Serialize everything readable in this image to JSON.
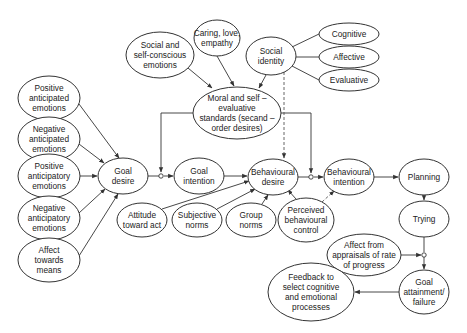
{
  "diagram": {
    "title": "",
    "nodes": [
      {
        "id": "pos_anticipated",
        "lines": [
          "Positive",
          "anticipated",
          "emotions"
        ],
        "cx": 49,
        "cy": 98,
        "rx": 31,
        "ry": 22
      },
      {
        "id": "neg_anticipated",
        "lines": [
          "Negative",
          "anticipated",
          "emotions"
        ],
        "cx": 49,
        "cy": 139,
        "rx": 31,
        "ry": 22
      },
      {
        "id": "pos_anticipatory",
        "lines": [
          "Positive",
          "anticipatory",
          "emotions"
        ],
        "cx": 49,
        "cy": 176,
        "rx": 31,
        "ry": 22
      },
      {
        "id": "neg_anticipatory",
        "lines": [
          "Negative",
          "anticipatory",
          "emotions"
        ],
        "cx": 49,
        "cy": 218,
        "rx": 31,
        "ry": 22
      },
      {
        "id": "affect_means",
        "lines": [
          "Affect",
          "towards",
          "means"
        ],
        "cx": 49,
        "cy": 260,
        "rx": 31,
        "ry": 22
      },
      {
        "id": "social_self_conscious",
        "lines": [
          "Social and",
          "self-conscious",
          "emotions"
        ],
        "cx": 160,
        "cy": 55,
        "rx": 34,
        "ry": 23
      },
      {
        "id": "caring",
        "lines": [
          "Caring, love,",
          "empathy"
        ],
        "cx": 217,
        "cy": 38,
        "rx": 23,
        "ry": 18
      },
      {
        "id": "social_identity",
        "lines": [
          "Social",
          "identity"
        ],
        "cx": 271,
        "cy": 56,
        "rx": 25,
        "ry": 19
      },
      {
        "id": "cognitive",
        "lines": [
          "Cognitive"
        ],
        "cx": 349,
        "cy": 34,
        "rx": 30,
        "ry": 11
      },
      {
        "id": "affective",
        "lines": [
          "Affective"
        ],
        "cx": 349,
        "cy": 57,
        "rx": 30,
        "ry": 11
      },
      {
        "id": "evaluative",
        "lines": [
          "Evaluative"
        ],
        "cx": 349,
        "cy": 80,
        "rx": 30,
        "ry": 11
      },
      {
        "id": "moral",
        "lines": [
          "Moral and self –",
          "evaluative",
          "standards (secand –",
          "order desires)"
        ],
        "cx": 237,
        "cy": 113,
        "rx": 44,
        "ry": 26
      },
      {
        "id": "goal_desire",
        "lines": [
          "Goal",
          "desire"
        ],
        "cx": 123,
        "cy": 176,
        "rx": 25,
        "ry": 18
      },
      {
        "id": "goal_intention",
        "lines": [
          "Goal",
          "intention"
        ],
        "cx": 199,
        "cy": 176,
        "rx": 25,
        "ry": 18
      },
      {
        "id": "behavioural_desire",
        "lines": [
          "Behavioural",
          "desire"
        ],
        "cx": 273,
        "cy": 177,
        "rx": 25,
        "ry": 18
      },
      {
        "id": "behavioural_intention",
        "lines": [
          "Behavioural",
          "intention"
        ],
        "cx": 349,
        "cy": 177,
        "rx": 25,
        "ry": 18
      },
      {
        "id": "planning",
        "lines": [
          "Planning"
        ],
        "cx": 424,
        "cy": 177,
        "rx": 25,
        "ry": 18
      },
      {
        "id": "trying",
        "lines": [
          "Trying"
        ],
        "cx": 424,
        "cy": 219,
        "rx": 25,
        "ry": 18
      },
      {
        "id": "attitude",
        "lines": [
          "Attitude",
          "toward act"
        ],
        "cx": 142,
        "cy": 220,
        "rx": 25,
        "ry": 17
      },
      {
        "id": "subjective_norms",
        "lines": [
          "Subjective",
          "norms"
        ],
        "cx": 197,
        "cy": 220,
        "rx": 25,
        "ry": 17
      },
      {
        "id": "group_norms",
        "lines": [
          "Group",
          "norms"
        ],
        "cx": 251,
        "cy": 220,
        "rx": 25,
        "ry": 17
      },
      {
        "id": "pbc",
        "lines": [
          "Perceived",
          "behavioural",
          "control"
        ],
        "cx": 306,
        "cy": 220,
        "rx": 28,
        "ry": 22
      },
      {
        "id": "affect_appraisals",
        "lines": [
          "Affect from",
          "appraisals of rate",
          "of progress"
        ],
        "cx": 364,
        "cy": 255,
        "rx": 37,
        "ry": 21
      },
      {
        "id": "goal_attainment",
        "lines": [
          "Goal",
          "attainment/",
          "failure"
        ],
        "cx": 424,
        "cy": 292,
        "rx": 25,
        "ry": 22
      },
      {
        "id": "feedback",
        "lines": [
          "Feedback to",
          "select cognitive",
          "and emotional",
          "processes"
        ],
        "cx": 311,
        "cy": 292,
        "rx": 43,
        "ry": 29
      }
    ],
    "edges": [
      {
        "from": "pos_anticipated",
        "to": "goal_desire",
        "style": "arrow"
      },
      {
        "from": "neg_anticipated",
        "to": "goal_desire",
        "style": "arrow"
      },
      {
        "from": "pos_anticipatory",
        "to": "goal_desire",
        "style": "arrow"
      },
      {
        "from": "neg_anticipatory",
        "to": "goal_desire",
        "style": "arrow"
      },
      {
        "from": "affect_means",
        "to": "goal_desire",
        "style": "arrow"
      },
      {
        "from": "goal_desire",
        "to": "goal_intention",
        "style": "arrow-junction",
        "moderator": "moral"
      },
      {
        "from": "goal_intention",
        "to": "behavioural_desire",
        "style": "arrow"
      },
      {
        "from": "attitude",
        "to": "behavioural_desire",
        "style": "arrow"
      },
      {
        "from": "subjective_norms",
        "to": "behavioural_desire",
        "style": "arrow"
      },
      {
        "from": "group_norms",
        "to": "behavioural_desire",
        "style": "arrow"
      },
      {
        "from": "pbc",
        "to": "behavioural_desire",
        "style": "arrow"
      },
      {
        "from": "pbc",
        "to": "behavioural_intention",
        "style": "dashed-arrow"
      },
      {
        "from": "behavioural_desire",
        "to": "behavioural_intention",
        "style": "arrow-junction",
        "moderator": "moral"
      },
      {
        "from": "behavioural_intention",
        "to": "planning",
        "style": "arrow"
      },
      {
        "from": "planning",
        "to": "trying",
        "style": "arrow"
      },
      {
        "from": "trying",
        "to": "goal_attainment",
        "style": "arrow-junction",
        "moderator": "affect_appraisals"
      },
      {
        "from": "goal_attainment",
        "to": "feedback",
        "style": "arrow"
      },
      {
        "from": "social_self_conscious",
        "to": "moral",
        "style": "arrow"
      },
      {
        "from": "caring",
        "to": "moral",
        "style": "arrow"
      },
      {
        "from": "social_identity",
        "to": "moral",
        "style": "arrow"
      },
      {
        "from": "social_identity",
        "to": "behavioural_desire",
        "style": "dashed-arrow"
      },
      {
        "from": "social_identity",
        "to": "cognitive",
        "style": "line"
      },
      {
        "from": "social_identity",
        "to": "affective",
        "style": "line"
      },
      {
        "from": "social_identity",
        "to": "evaluative",
        "style": "line"
      }
    ]
  },
  "colors": {
    "stroke": "#333333",
    "background": "#ffffff",
    "text": "#222222"
  }
}
